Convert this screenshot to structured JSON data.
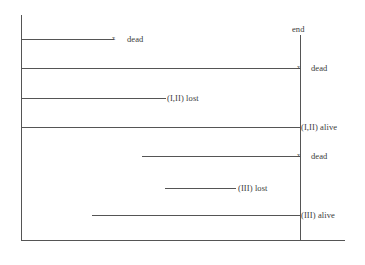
{
  "figure": {
    "stroke_color": "#555555",
    "text_color": "#3a3a3a",
    "background": "#ffffff"
  },
  "axes": {
    "left_rule": {
      "name": "start-axis",
      "x": 21,
      "y1": 15,
      "y2": 240
    },
    "right_rule": {
      "name": "end-axis",
      "x": 300,
      "y1": 35,
      "y2": 240
    },
    "baseline": {
      "name": "baseline",
      "x1": 21,
      "y1": 240,
      "x2": 345,
      "y2": 241
    }
  },
  "end_label": {
    "text": "end",
    "x": 292,
    "y": 25
  },
  "rows": [
    {
      "id": "row-1",
      "label": "dead",
      "label_x": 127,
      "label_y": 35,
      "line_x1": 21,
      "line_x2": 114,
      "line_y": 39,
      "marker": "x",
      "marker_x": 112,
      "marker_y": 35
    },
    {
      "id": "row-2",
      "label": "dead",
      "label_x": 311,
      "label_y": 64,
      "line_x1": 21,
      "line_x2": 300,
      "line_y": 68,
      "marker": "x",
      "marker_x": 297,
      "marker_y": 64
    },
    {
      "id": "row-3",
      "label": "(I,II) lost",
      "label_x": 167,
      "label_y": 94,
      "line_x1": 21,
      "line_x2": 166,
      "line_y": 98,
      "marker": "",
      "marker_x": 0,
      "marker_y": 0
    },
    {
      "id": "row-4",
      "label": "(I,II) alive",
      "label_x": 301,
      "label_y": 123,
      "line_x1": 21,
      "line_x2": 300,
      "line_y": 127,
      "marker": "",
      "marker_x": 0,
      "marker_y": 0
    },
    {
      "id": "row-5",
      "label": "dead",
      "label_x": 311,
      "label_y": 152,
      "line_x1": 142,
      "line_x2": 300,
      "line_y": 156,
      "marker": "x",
      "marker_x": 297,
      "marker_y": 152
    },
    {
      "id": "row-6",
      "label": "(III) lost",
      "label_x": 238,
      "label_y": 184,
      "line_x1": 165,
      "line_x2": 236,
      "line_y": 188,
      "marker": "",
      "marker_x": 0,
      "marker_y": 0
    },
    {
      "id": "row-7",
      "label": "(III) alive",
      "label_x": 301,
      "label_y": 211,
      "line_x1": 92,
      "line_x2": 300,
      "line_y": 215,
      "marker": "",
      "marker_x": 0,
      "marker_y": 0
    }
  ]
}
